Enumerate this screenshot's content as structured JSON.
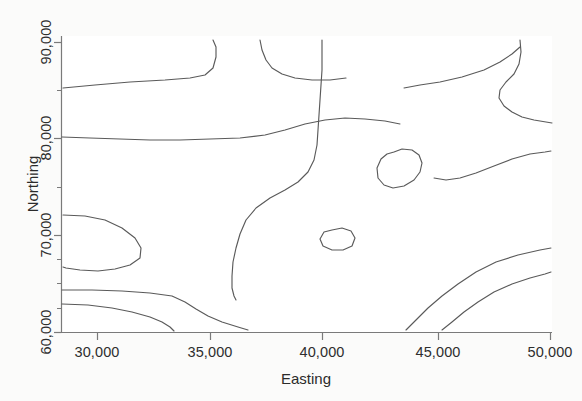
{
  "figure": {
    "background_color": "#ffffff",
    "line_color": "#5a5a5a",
    "axis_color": "#7a7a7a",
    "text_color": "#2e2e2e"
  },
  "chart_data": {
    "type": "line",
    "title": "",
    "subtitle": "",
    "xlabel": "Easting",
    "ylabel": "Northing",
    "xlim": [
      29150,
      50000
    ],
    "ylim": [
      60000,
      91000
    ],
    "grid": false,
    "legend": null,
    "annotations": [],
    "x_ticks": [
      {
        "value": 30000,
        "label": "30,000",
        "px": 97
      },
      {
        "value": 35000,
        "label": "35,000",
        "px": 210
      },
      {
        "value": 40000,
        "label": "40,000",
        "px": 322
      },
      {
        "value": 45000,
        "label": "45,000",
        "px": 438
      },
      {
        "value": 50000,
        "label": "50,000",
        "px": 550
      }
    ],
    "y_ticks": [
      {
        "value": 90000,
        "label": "90,000",
        "px": 42
      },
      {
        "value": 80000,
        "label": "80,000",
        "px": 138
      },
      {
        "value": 70000,
        "label": "70,000",
        "px": 235
      },
      {
        "value": 60000,
        "label": "60,000",
        "px": 332
      }
    ],
    "y_minor_ticks": [
      {
        "value": 85000,
        "px": 90
      },
      {
        "value": 75000,
        "px": 187
      },
      {
        "value": 67500,
        "px": 259
      },
      {
        "value": 65000,
        "px": 283
      },
      {
        "value": 62500,
        "px": 308
      }
    ],
    "series": [
      {
        "name": "contour-1-upper-left",
        "points": "63,88 95,85 130,82 165,80 190,78 205,75 213,68 216,57 216,47 213,40"
      },
      {
        "name": "contour-2-upper-middle",
        "points": "260,40 262,50 266,60 272,68 282,74 295,78 312,80 330,80 346,78"
      },
      {
        "name": "contour-3-upper-right",
        "points": "404,88 420,85 440,82 462,77 484,70 500,62 512,54 520,47"
      },
      {
        "name": "contour-4-right-s",
        "points": "520,40 521,52 519,64 514,74 506,82 500,90 499,98 504,106 512,112 522,117 534,120 546,122 552,123"
      },
      {
        "name": "contour-5-eighty-band",
        "points": "62,137 90,138 120,139 150,140 180,140 210,139 240,138 265,135 285,130 305,124 325,120 345,118 365,119 385,121 400,124"
      },
      {
        "name": "contour-6-center-ridge",
        "points": "322,40 322,55 322,70 321,85 320,100 319,115 318,130 317,145 314,160 308,172 298,182 285,190 270,198 256,208 246,220 240,234 236,248 233,262 232,276 232,288 234,296 236,300"
      },
      {
        "name": "contour-7-left-lobe",
        "points": "63,215 85,216 105,220 122,228 135,238 141,248 140,258 130,265 115,269 98,271 80,270 66,268 63,267"
      },
      {
        "name": "contour-8-lower-left-a",
        "points": "62,290 92,290 122,291 150,293 172,296 185,302 196,309 208,316 222,322 238,327 248,330"
      },
      {
        "name": "contour-9-lower-left-b",
        "points": "62,304 88,305 112,308 132,312 150,317 162,322 170,327 174,331"
      },
      {
        "name": "contour-10-blob-upper",
        "points": "394,152 402,149 412,150 419,155 422,163 420,172 414,180 404,186 393,188 384,185 378,178 377,168 381,159 387,154 394,152"
      },
      {
        "name": "contour-11-blob-lower",
        "points": "332,230 342,228 351,231 355,238 352,246 343,250 332,250 323,246 320,239 324,232 332,230"
      },
      {
        "name": "contour-12-right-upper-diag",
        "points": "434,178 446,180 460,178 476,173 494,166 512,159 530,154 545,152 551,151"
      },
      {
        "name": "contour-13-right-mid-diag",
        "points": "406,330 416,320 428,308 442,296 458,284 476,272 496,262 518,255 540,250 551,248"
      },
      {
        "name": "contour-14-right-low-diag",
        "points": "442,330 452,322 464,312 478,302 494,292 512,284 530,278 545,274 551,272"
      }
    ]
  },
  "axes": {
    "x_title": "Easting",
    "y_title": "Northing"
  }
}
